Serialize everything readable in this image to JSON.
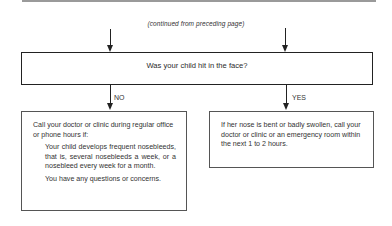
{
  "page": {
    "continued_note": "(continued from preceding page)",
    "question": "Was your child hit in the face?",
    "branches": {
      "no": {
        "label": "NO",
        "intro": "Call your doctor or clinic during regular office or phone hours if:",
        "conditions": [
          "Your child develops frequent nosebleeds, that is, several nosebleeds a week, or a nosebleed every week for a month.",
          "You have any questions or concerns."
        ]
      },
      "yes": {
        "label": "YES",
        "text": "If her nose is bent or badly swollen, call your doctor or clinic or an emergency room within the next 1 to 2 hours."
      }
    }
  }
}
